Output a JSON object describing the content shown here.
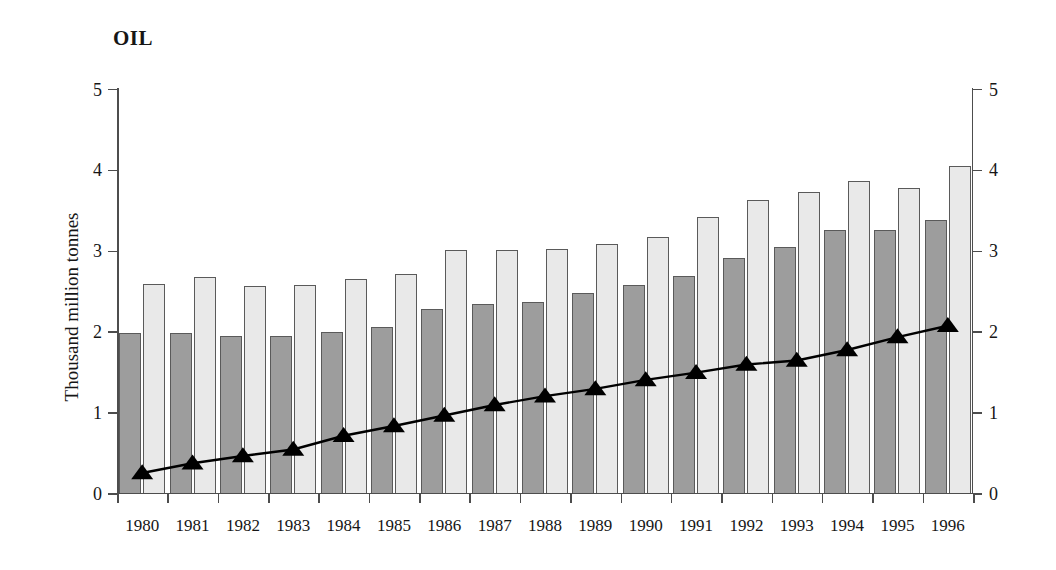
{
  "title": "OIL",
  "axes": {
    "ylabel": "Thousand million tonnes",
    "xlabel": "",
    "yticks": [
      "0",
      "1",
      "2",
      "3",
      "4",
      "5"
    ],
    "yticks_right": [
      "0",
      "1",
      "2",
      "3",
      "4",
      "5"
    ],
    "ylim": [
      0,
      5
    ]
  },
  "colors": {
    "bar_dark": "#9d9d9d",
    "bar_light": "#e9e9e9",
    "bar_edge": "#5a5a5a",
    "line": "#000000",
    "marker": "#000000",
    "axis": "#4d4d4d",
    "text": "#161616"
  },
  "chart_data": {
    "type": "bar",
    "title": "OIL",
    "xlabel": "",
    "ylabel": "Thousand million tonnes",
    "ylim": [
      0,
      5
    ],
    "grid": false,
    "legend": "none",
    "categories": [
      "1980",
      "1981",
      "1982",
      "1983",
      "1984",
      "1985",
      "1986",
      "1987",
      "1988",
      "1989",
      "1990",
      "1991",
      "1992",
      "1993",
      "1994",
      "1995",
      "1996"
    ],
    "series": [
      {
        "name": "Series 1 (dark bars)",
        "type": "bar",
        "color": "#9d9d9d",
        "values": [
          1.97,
          1.97,
          1.93,
          1.94,
          1.98,
          2.04,
          2.27,
          2.33,
          2.35,
          2.47,
          2.56,
          2.68,
          2.9,
          3.03,
          3.24,
          3.24,
          3.37
        ]
      },
      {
        "name": "Series 2 (light bars)",
        "type": "bar",
        "color": "#e9e9e9",
        "values": [
          2.58,
          2.66,
          2.55,
          2.57,
          2.64,
          2.7,
          3.0,
          3.0,
          3.01,
          3.07,
          3.16,
          3.4,
          3.61,
          3.72,
          3.85,
          3.77,
          4.03
        ]
      },
      {
        "name": "Series 3 (triangle line)",
        "type": "line",
        "color": "#000000",
        "marker": "triangle-up",
        "values": [
          0.26,
          0.38,
          0.47,
          0.55,
          0.72,
          0.84,
          0.97,
          1.1,
          1.21,
          1.3,
          1.41,
          1.5,
          1.6,
          1.65,
          1.78,
          1.94,
          2.08
        ]
      }
    ]
  }
}
